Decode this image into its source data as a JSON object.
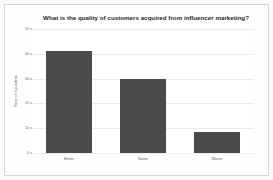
{
  "chart_data": {
    "type": "bar",
    "title": "What is the quality of customers acquired from influencer marketing?",
    "categories": [
      "Better",
      "Same",
      "Worse"
    ],
    "values": [
      41,
      30,
      8.5
    ],
    "xlabel": "",
    "ylabel": "Share of respondents",
    "ylim": [
      0,
      50
    ],
    "yticks": [
      0,
      10,
      20,
      30,
      40,
      50
    ],
    "ytick_labels": [
      "0",
      "10",
      "20",
      "30",
      "40",
      "50"
    ],
    "grid": true,
    "legend": "none",
    "bar_color": "#4b4b4d",
    "background_color": "#fdfdfd",
    "title_color": "#1f1f2e"
  }
}
